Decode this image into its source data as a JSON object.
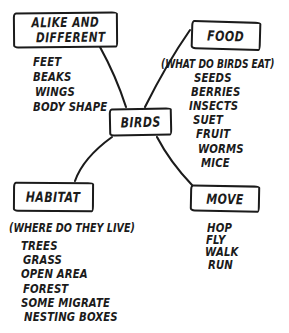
{
  "map": {
    "center": {
      "label": "BIRDS"
    },
    "branches": {
      "alike_different": {
        "label_line1": "ALIKE AND",
        "label_line2": "DIFFERENT",
        "items": [
          "FEET",
          "BEAKS",
          "WINGS",
          "BODY SHAPE"
        ]
      },
      "food": {
        "label": "FOOD",
        "caption": "(WHAT DO BIRDS EAT)",
        "items": [
          "SEEDS",
          "BERRIES",
          "INSECTS",
          "SUET",
          "FRUIT",
          "WORMS",
          "MICE"
        ]
      },
      "habitat": {
        "label": "HABITAT",
        "caption": "(WHERE DO THEY LIVE)",
        "items": [
          "TREES",
          "GRASS",
          "OPEN AREA",
          "FOREST",
          "SOME MIGRATE",
          "NESTING BOXES"
        ]
      },
      "move": {
        "label": "MOVE",
        "items": [
          "HOP",
          "FLY",
          "WALK",
          "RUN"
        ]
      }
    },
    "colors": {
      "ink": "#1b1b1b",
      "paper": "#ffffff"
    }
  }
}
